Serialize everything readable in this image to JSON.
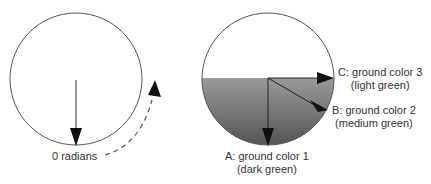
{
  "left_diagram": {
    "label": "0 radians"
  },
  "right_diagram": {
    "labels": {
      "a_line1": "A: ground color 1",
      "a_line2": "(dark green)",
      "b_line1": "B: ground color 2",
      "b_line2": "(medium green)",
      "c_line1": "C: ground color 3",
      "c_line2": "(light green)"
    },
    "colors": {
      "gradient_top": "#d8d8d8",
      "gradient_bottom": "#5a5a5a"
    }
  }
}
